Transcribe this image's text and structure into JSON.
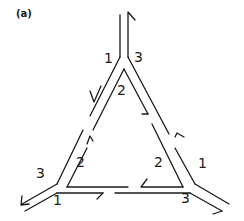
{
  "panel_label": "(a)",
  "colors": {
    "stroke": "#1a1a1a",
    "background": "#ffffff"
  },
  "labels": {
    "top_left": "1",
    "top_right": "3",
    "top_inner": "2",
    "left_outer": "3",
    "left_inner": "2",
    "right_inner": "2",
    "right_outer": "1",
    "bottom_left": "1",
    "bottom_right": "3"
  }
}
